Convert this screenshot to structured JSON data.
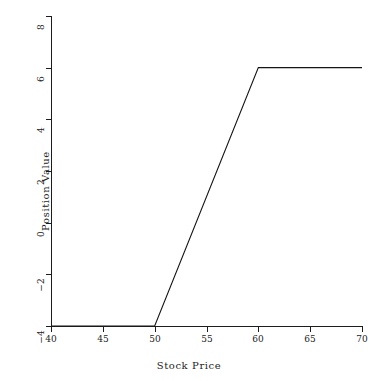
{
  "chart_data": {
    "type": "line",
    "title": "",
    "xlabel": "Stock Price",
    "ylabel": "Position Value",
    "xlim": [
      40,
      70
    ],
    "ylim": [
      -4,
      8
    ],
    "xticks": [
      40,
      45,
      50,
      55,
      60,
      65,
      70
    ],
    "yticks": [
      8,
      6,
      4,
      2,
      0,
      -2,
      -4
    ],
    "xtick_labels": [
      "40",
      "45",
      "50",
      "55",
      "60",
      "65",
      "70"
    ],
    "ytick_labels": [
      "8",
      "6",
      "4",
      "2",
      "0",
      "−2",
      "−4"
    ],
    "grid": false,
    "legend": null,
    "line_color": "#141414",
    "series": [
      {
        "name": "Position Value",
        "x": [
          40,
          50,
          60,
          70
        ],
        "values": [
          -4,
          -4,
          6,
          6
        ]
      }
    ],
    "annotations": [],
    "description_points": [
      {
        "x": 40,
        "y": -4
      },
      {
        "x": 50,
        "y": -4
      },
      {
        "x": 60,
        "y": 6
      },
      {
        "x": 70,
        "y": 6
      }
    ]
  }
}
